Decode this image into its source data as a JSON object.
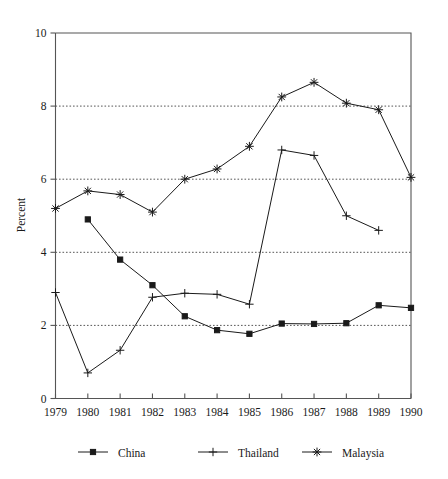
{
  "chart_data": {
    "type": "line",
    "title": "",
    "subtitle": "",
    "xlabel": "",
    "ylabel": "Percent",
    "x": [
      "1979",
      "1980",
      "1981",
      "1982",
      "1983",
      "1984",
      "1985",
      "1986",
      "1987",
      "1988",
      "1989",
      "1990"
    ],
    "categories": [
      "1979",
      "1980",
      "1981",
      "1982",
      "1983",
      "1984",
      "1985",
      "1986",
      "1987",
      "1988",
      "1989",
      "1990"
    ],
    "xlim": [
      1979,
      1990
    ],
    "ylim": [
      0,
      10
    ],
    "yticks": [
      "0",
      "2",
      "4",
      "6",
      "8",
      "10"
    ],
    "ytick_values": [
      0,
      2,
      4,
      6,
      8,
      10
    ],
    "grid": "horizontal-dotted-at-2-4-6-8",
    "legend_position": "below",
    "series": [
      {
        "name": "China",
        "marker": "filled-square",
        "values": [
          null,
          4.9,
          3.8,
          3.1,
          2.25,
          1.87,
          1.77,
          2.05,
          2.04,
          2.06,
          2.55,
          2.48
        ]
      },
      {
        "name": "Thailand",
        "marker": "plus",
        "values": [
          2.9,
          0.7,
          1.32,
          2.77,
          2.88,
          2.85,
          2.58,
          6.8,
          6.65,
          5.0,
          4.6,
          null
        ]
      },
      {
        "name": "Malaysia",
        "marker": "asterisk",
        "values": [
          5.2,
          5.68,
          5.58,
          5.1,
          6.0,
          6.28,
          6.9,
          8.25,
          8.65,
          8.08,
          7.9,
          6.05
        ]
      }
    ]
  },
  "legend": {
    "items": [
      {
        "label": "China",
        "marker": "filled-square"
      },
      {
        "label": "Thailand",
        "marker": "plus"
      },
      {
        "label": "Malaysia",
        "marker": "asterisk"
      }
    ]
  },
  "colors": {
    "line": "#1a1a1a",
    "axis": "#555555",
    "grid": "#444444",
    "background": "#ffffff"
  }
}
